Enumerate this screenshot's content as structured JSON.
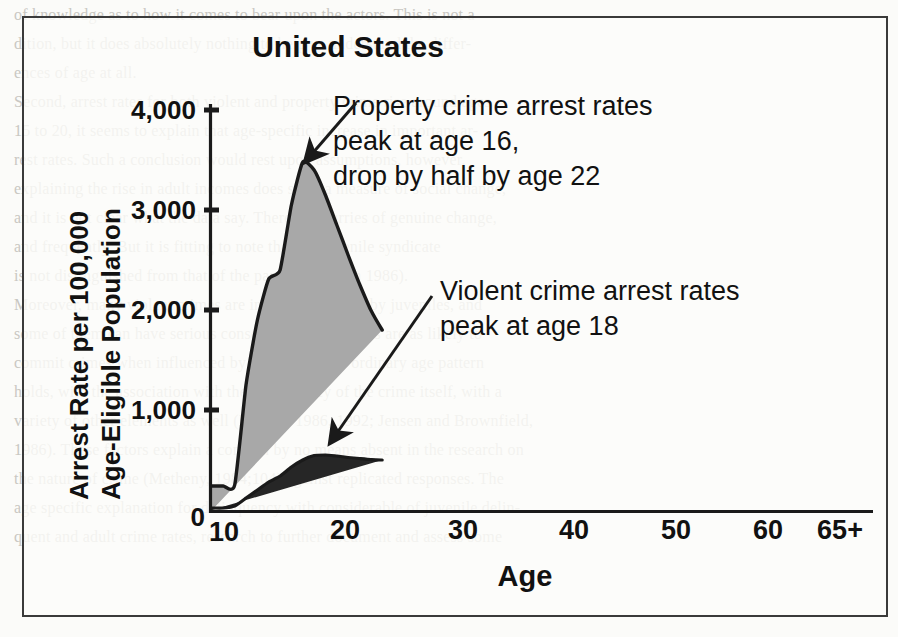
{
  "figure": {
    "title": "United States",
    "y_axis_label_line1": "Arrest Rate per 100,000",
    "y_axis_label_line2": "Age-Eligible Population",
    "x_axis_label": "Age",
    "annotation_property": {
      "line1": "Property crime arrest rates",
      "line2": "peak at age 16,",
      "line3": "drop by half by age 22"
    },
    "annotation_violent": {
      "line1": "Violent crime arrest rates",
      "line2": "peak at age 18"
    }
  },
  "colors": {
    "property_fill": "#a8a8a8",
    "violent_fill": "#262626",
    "outline": "#1a1a1a",
    "frame": "#3a3a3a",
    "text": "#111111"
  },
  "page_bleed_lines": [
    "of knowledge as to how it comes to bear upon the actors. This is not a",
    "dition, but it does absolutely nothing to help us understand the differ-",
    "ences of age at all.",
    "",
    "Second, arrest rates for both violent and property crime rise around ages",
    "15 to 20, it seems to explain that age-specific increase in important ar-",
    "rest rates.  Such a conclusion would rest upon assumptions, however,",
    "explaining the rise in adult incomes does so as a measure of social change,",
    "and it is not clear what the data say. There are flurries of genuine change,",
    "and frequently. But it is fitting to note that the juvenile syndicate",
    "is not distinguished from that of the parents (Morash 1986).",
    "Moreover, many violent crimes are in fact committed by juveniles, and",
    "some of them can have serious consequences. Juveniles are as likely to",
    "commit crimes when influenced by others, and the ordinary age pattern",
    "holds, with the association with the delinquency of the crime itself, with a",
    "variety of other elements as well (Murray, 1986, 1992; Jensen and Brownfield,",
    "1986). These factors explain a concern by no means absent in the research on",
    "the nature of crime (Metheny, 1984;104) against replicated responses. The",
    "age specific explanation for delinquency with considerable of juvenile delin-",
    "quent and adult crime rates, research to further document and assess some"
  ],
  "chart_data": {
    "type": "area",
    "title": "United States",
    "xlabel": "Age",
    "ylabel": "Arrest Rate per 100,000 Age-Eligible Population",
    "xlim": [
      9,
      67
    ],
    "ylim": [
      0,
      4300
    ],
    "yticks": [
      0,
      1000,
      2000,
      3000,
      4000
    ],
    "ytick_labels": [
      "0",
      "1,000",
      "2,000",
      "3,000",
      "4,000"
    ],
    "xticks": [
      10,
      20,
      30,
      40,
      50,
      60,
      65
    ],
    "xtick_labels": [
      "10",
      "20",
      "30",
      "40",
      "50",
      "60",
      "65+"
    ],
    "grid": false,
    "legend": "none",
    "stacked": true,
    "ages": [
      9,
      10,
      11,
      12,
      13,
      14,
      15,
      16,
      17,
      18,
      19,
      20,
      21,
      22,
      23,
      24,
      25,
      26,
      27,
      28,
      29,
      30,
      31,
      32,
      33,
      34,
      35,
      36,
      37,
      38,
      39,
      40,
      41,
      42,
      43,
      44,
      45,
      46,
      47,
      48,
      49,
      50,
      51,
      52,
      53,
      54,
      55,
      56,
      57,
      58,
      59,
      60,
      61,
      62,
      63,
      64,
      65
    ],
    "series": [
      {
        "name": "Property crime arrest rate (total, stacked top)",
        "values": [
          240,
          240,
          250,
          1250,
          1900,
          2310,
          2400,
          3050,
          3480,
          3400,
          3150,
          2850,
          2550,
          2260,
          2000,
          1800,
          1650,
          1530,
          1430,
          1340,
          1250,
          1210,
          1180,
          1170,
          1160,
          1150,
          1000,
          980,
          960,
          950,
          940,
          870,
          840,
          820,
          800,
          790,
          660,
          640,
          620,
          600,
          580,
          500,
          470,
          450,
          430,
          420,
          370,
          350,
          330,
          320,
          310,
          280,
          260,
          250,
          240,
          230,
          180
        ]
      },
      {
        "name": "Violent crime arrest rate",
        "values": [
          20,
          20,
          40,
          120,
          200,
          280,
          340,
          430,
          500,
          545,
          550,
          540,
          525,
          515,
          505,
          500,
          495,
          490,
          485,
          480,
          475,
          450,
          445,
          440,
          435,
          430,
          390,
          385,
          380,
          375,
          370,
          330,
          325,
          320,
          315,
          310,
          260,
          255,
          250,
          245,
          240,
          200,
          195,
          190,
          185,
          180,
          150,
          145,
          140,
          135,
          130,
          110,
          105,
          100,
          95,
          90,
          70
        ]
      }
    ],
    "annotations": [
      {
        "text": "Property crime arrest rates peak at age 16, drop by half by age 22",
        "points_to_age": 16,
        "points_to_value": 3480
      },
      {
        "text": "Violent crime arrest rates peak at age 18",
        "points_to_age": 18,
        "points_to_value": 545
      }
    ]
  }
}
